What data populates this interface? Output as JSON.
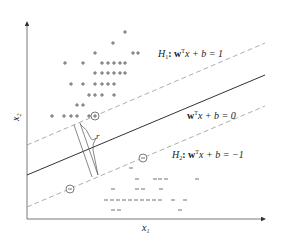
{
  "axes": {
    "x_label": "x",
    "x_sub": "1",
    "y_label": "x",
    "y_sub": "2"
  },
  "labels": {
    "h1": {
      "name": "H",
      "sub": "1",
      "eq": ": w",
      "sup": "T",
      "rest": "x + b = 1"
    },
    "h0": {
      "name": "",
      "sub": "",
      "eq": "w",
      "sup": "T",
      "rest": "x + b = 0"
    },
    "h2": {
      "name": "H",
      "sub": "2",
      "eq": ": w",
      "sup": "T",
      "rest": "x + b = −1"
    },
    "margin": "r"
  },
  "symbols": {
    "positive": "+",
    "negative": "−"
  },
  "colors": {
    "axis": "#333333",
    "solid": "#333333",
    "dashed": "#999999",
    "text": "#222222"
  },
  "positive_points": [
    [
      125,
      32
    ],
    [
      113,
      43
    ],
    [
      95,
      53
    ],
    [
      133,
      53
    ],
    [
      138,
      53
    ],
    [
      65,
      63
    ],
    [
      83,
      63
    ],
    [
      102,
      63
    ],
    [
      108,
      63
    ],
    [
      114,
      63
    ],
    [
      120,
      63
    ],
    [
      125,
      63
    ],
    [
      95,
      73
    ],
    [
      102,
      73
    ],
    [
      108,
      73
    ],
    [
      114,
      73
    ],
    [
      120,
      73
    ],
    [
      125,
      73
    ],
    [
      71,
      84
    ],
    [
      83,
      84
    ],
    [
      95,
      84
    ],
    [
      102,
      84
    ],
    [
      108,
      84
    ],
    [
      114,
      84
    ],
    [
      89,
      95
    ],
    [
      95,
      95
    ],
    [
      102,
      95
    ],
    [
      114,
      95
    ],
    [
      77,
      105
    ],
    [
      83,
      105
    ],
    [
      52,
      116
    ],
    [
      64,
      116
    ],
    [
      71,
      116
    ],
    [
      77,
      116
    ],
    [
      89,
      116
    ]
  ],
  "negative_points": [
    [
      131,
      168
    ],
    [
      137,
      179
    ],
    [
      155,
      179
    ],
    [
      160,
      179
    ],
    [
      166,
      179
    ],
    [
      197,
      179
    ],
    [
      113,
      189
    ],
    [
      137,
      189
    ],
    [
      143,
      189
    ],
    [
      161,
      189
    ],
    [
      106,
      200
    ],
    [
      112,
      200
    ],
    [
      118,
      200
    ],
    [
      124,
      200
    ],
    [
      130,
      200
    ],
    [
      136,
      200
    ],
    [
      142,
      200
    ],
    [
      148,
      200
    ],
    [
      154,
      200
    ],
    [
      160,
      200
    ],
    [
      173,
      200
    ],
    [
      185,
      200
    ],
    [
      113,
      210
    ],
    [
      119,
      210
    ],
    [
      180,
      210
    ]
  ],
  "support_vectors": [
    {
      "class": "positive",
      "at": [
        95,
        116
      ]
    },
    {
      "class": "negative",
      "at": [
        143,
        158
      ]
    },
    {
      "class": "negative",
      "at": [
        70,
        189
      ]
    }
  ]
}
